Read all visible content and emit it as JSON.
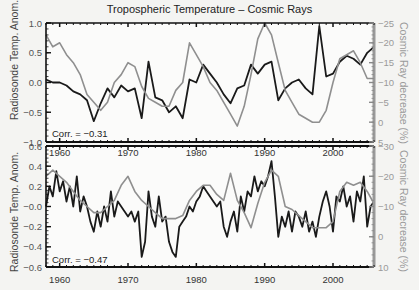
{
  "chart_data": [
    {
      "type": "line",
      "panel": "top",
      "title": "Tropospheric Temperature – Cosmic Rays",
      "xlabel": "",
      "ylabel_left": "Radiosonde Temp. Anom.",
      "ylabel_right": "Cosmic Ray decrease (%)",
      "xlim": [
        1958,
        2006
      ],
      "ylim_left": [
        -1.0,
        1.0
      ],
      "ylim_right": [
        5,
        -25
      ],
      "yticks_left": [
        "1.0",
        "0.5",
        "0.0",
        "-0.5",
        "-1.0"
      ],
      "yticks_right": [
        "-25",
        "-20",
        "-15",
        "-10",
        "-5",
        "0",
        "5"
      ],
      "xticks": [
        "1960",
        "1970",
        "1980",
        "1990",
        "2000"
      ],
      "annotation": "Corr.  =  −0.31",
      "series": [
        {
          "name": "Radiosonde Temp. Anom.",
          "axis": "left",
          "color": "#1a1a1a",
          "x": [
            1958,
            1959,
            1960,
            1961,
            1962,
            1963,
            1964,
            1965,
            1966,
            1967,
            1968,
            1969,
            1970,
            1971,
            1972,
            1973,
            1974,
            1975,
            1976,
            1977,
            1978,
            1979,
            1980,
            1981,
            1982,
            1983,
            1984,
            1985,
            1986,
            1987,
            1988,
            1989,
            1990,
            1991,
            1992,
            1993,
            1994,
            1995,
            1996,
            1997,
            1998,
            1999,
            2000,
            2001,
            2002,
            2003,
            2004,
            2005,
            2006
          ],
          "values": [
            0.05,
            0.0,
            0.0,
            -0.05,
            -0.15,
            -0.2,
            -0.3,
            -0.65,
            -0.35,
            -0.1,
            -0.25,
            -0.05,
            -0.15,
            -0.1,
            -0.6,
            0.35,
            -0.25,
            -0.3,
            -0.5,
            -0.4,
            -0.6,
            0.05,
            0.0,
            0.3,
            0.15,
            0.0,
            -0.2,
            -0.35,
            -0.1,
            -0.05,
            0.3,
            0.15,
            0.3,
            0.35,
            -0.3,
            -0.1,
            0.0,
            0.05,
            -0.1,
            -0.2,
            0.95,
            0.1,
            0.15,
            0.35,
            0.45,
            0.4,
            0.3,
            0.5,
            0.6
          ]
        },
        {
          "name": "Cosmic Ray decrease (%)",
          "axis": "right",
          "color": "#8f8f8f",
          "x": [
            1958,
            1959,
            1960,
            1961,
            1962,
            1963,
            1964,
            1965,
            1966,
            1967,
            1968,
            1969,
            1970,
            1971,
            1972,
            1973,
            1974,
            1975,
            1976,
            1977,
            1978,
            1979,
            1980,
            1981,
            1982,
            1983,
            1984,
            1985,
            1986,
            1987,
            1988,
            1989,
            1990,
            1991,
            1992,
            1993,
            1994,
            1995,
            1996,
            1997,
            1998,
            1999,
            2000,
            2001,
            2002,
            2003,
            2004,
            2005,
            2006
          ],
          "values": [
            -22,
            -19,
            -20,
            -17,
            -15,
            -12,
            -7,
            -5,
            -3,
            -5,
            -10,
            -12,
            -15,
            -14,
            -9,
            -6,
            -5,
            -4,
            -4,
            -8,
            -10,
            -20,
            -17,
            -14,
            -10,
            -8,
            -5,
            -2,
            1,
            -4,
            -12,
            -21,
            -25,
            -22,
            -15,
            -8,
            -5,
            -2,
            -1,
            0,
            0,
            -3,
            -10,
            -16,
            -17,
            -18,
            -15,
            -11,
            -11
          ]
        }
      ]
    },
    {
      "type": "line",
      "panel": "bottom",
      "xlabel": "",
      "ylabel_left": "Radiosonde Temp. Anom.",
      "ylabel_right": "Cosmic Ray decrease (%)",
      "xlim": [
        1958,
        2006
      ],
      "ylim_left": [
        -0.6,
        0.6
      ],
      "ylim_right": [
        10,
        -30
      ],
      "yticks_left": [
        "0.6",
        "0.4",
        "0.2",
        "-0.0",
        "-0.2",
        "-0.4",
        "-0.6"
      ],
      "yticks_right": [
        "-30",
        "-20",
        "-10",
        "0",
        "10"
      ],
      "xticks": [
        "1960",
        "1970",
        "1980",
        "1990",
        "2000"
      ],
      "annotation": "Corr.  =  −0.47",
      "series": [
        {
          "name": "Radiosonde Temp. Anom.",
          "axis": "left",
          "color": "#1a1a1a",
          "x": [
            1958,
            1958.5,
            1959,
            1959.5,
            1960,
            1960.5,
            1961,
            1961.5,
            1962,
            1962.5,
            1963,
            1963.5,
            1964,
            1964.5,
            1965,
            1965.5,
            1966,
            1966.5,
            1967,
            1967.5,
            1968,
            1968.5,
            1969,
            1969.5,
            1970,
            1970.5,
            1971,
            1971.5,
            1972,
            1972.5,
            1973,
            1973.5,
            1974,
            1974.5,
            1975,
            1975.5,
            1976,
            1976.5,
            1977,
            1977.5,
            1978,
            1978.5,
            1979,
            1979.5,
            1980,
            1980.5,
            1981,
            1981.5,
            1982,
            1982.5,
            1983,
            1983.5,
            1984,
            1984.5,
            1985,
            1985.5,
            1986,
            1986.5,
            1987,
            1987.5,
            1988,
            1988.5,
            1989,
            1989.5,
            1990,
            1990.5,
            1991,
            1991.5,
            1992,
            1992.5,
            1993,
            1993.5,
            1994,
            1994.5,
            1995,
            1995.5,
            1996,
            1996.5,
            1997,
            1997.5,
            1998,
            1998.5,
            1999,
            1999.5,
            2000,
            2000.5,
            2001,
            2001.5,
            2002,
            2002.5,
            2003,
            2003.5,
            2004,
            2004.5,
            2005,
            2005.5,
            2006
          ],
          "values": [
            0.0,
            0.2,
            0.1,
            0.35,
            0.15,
            0.25,
            0.05,
            0.2,
            0.0,
            0.3,
            -0.05,
            0.1,
            0.0,
            -0.15,
            -0.25,
            -0.05,
            -0.2,
            0.0,
            -0.15,
            0.15,
            -0.1,
            0.05,
            0.0,
            -0.05,
            -0.1,
            -0.05,
            -0.15,
            -0.05,
            -0.5,
            -0.35,
            0.15,
            -0.1,
            -0.2,
            0.1,
            -0.15,
            -0.1,
            -0.35,
            -0.45,
            -0.5,
            -0.2,
            -0.15,
            -0.1,
            0.0,
            -0.05,
            0.05,
            0.1,
            0.2,
            0.15,
            0.1,
            0.05,
            0.0,
            0.05,
            -0.2,
            -0.3,
            -0.15,
            -0.05,
            -0.25,
            0.1,
            -0.05,
            0.15,
            0.1,
            0.3,
            0.15,
            0.25,
            0.2,
            0.3,
            0.45,
            0.1,
            -0.3,
            -0.1,
            -0.2,
            -0.05,
            -0.25,
            -0.05,
            -0.1,
            -0.2,
            -0.05,
            -0.25,
            -0.15,
            -0.3,
            -0.1,
            0.05,
            0.15,
            0.0,
            -0.25,
            0.1,
            0.05,
            0.2,
            0.0,
            0.1,
            -0.15,
            0.15,
            0.05,
            0.3,
            -0.2,
            0.0,
            0.05
          ]
        },
        {
          "name": "Cosmic Ray decrease (%)",
          "axis": "right",
          "color": "#8f8f8f",
          "x": [
            1958,
            1959,
            1960,
            1961,
            1962,
            1963,
            1964,
            1965,
            1966,
            1967,
            1968,
            1969,
            1970,
            1971,
            1972,
            1973,
            1974,
            1975,
            1976,
            1977,
            1978,
            1979,
            1980,
            1981,
            1982,
            1983,
            1984,
            1985,
            1986,
            1987,
            1988,
            1989,
            1990,
            1991,
            1992,
            1993,
            1994,
            1995,
            1996,
            1997,
            1998,
            1999,
            2000,
            2001,
            2002,
            2003,
            2004,
            2005,
            2006
          ],
          "values": [
            -20,
            -22,
            -20,
            -18,
            -15,
            -12,
            -10,
            -8,
            -8,
            -10,
            -12,
            -17,
            -20,
            -15,
            -12,
            -10,
            -8,
            -6,
            -6,
            -6,
            -7,
            -12,
            -15,
            -17,
            -17,
            -14,
            -12,
            -21,
            -12,
            -8,
            -3,
            -11,
            -18,
            -22,
            -20,
            -10,
            -9,
            -7,
            -5,
            -3,
            -3,
            -3,
            -5,
            -15,
            -18,
            -17,
            -18,
            -15,
            -11
          ]
        }
      ]
    }
  ]
}
